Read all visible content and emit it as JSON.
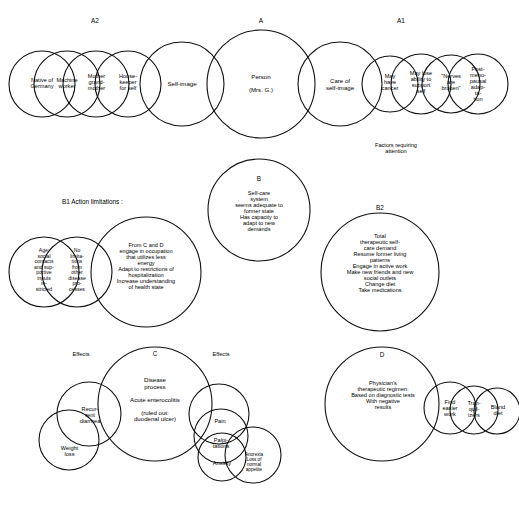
{
  "diagram": {
    "title_labels": {
      "a": "A",
      "a1": "A1",
      "a2": "A2",
      "b": "B",
      "b1": "B1  Action limitations :",
      "b2": "B2",
      "c": "C",
      "d": "D"
    },
    "annotations": {
      "factors_requiring_attention": "Factors requiring\nattention",
      "effects_left": "Effects",
      "effects_right": "Effects"
    },
    "nodes": {
      "person": "Person\n\n(Mrs. G.)",
      "self_image": "Self-image",
      "care_of_self_image": "Care of\nself-image",
      "housekeeper": "House-\nkeeper\nfor self",
      "mother_grandmother": "Mother\ngrand-\nmother",
      "machine_worker": "Machine\nworker",
      "native_of_germany": "Native of\nGermany",
      "may_have_cancer": "May\nhave\ncancer",
      "may_lose_ability": "May lose\nability to\nsupport\nself",
      "nerves_broken": "\"Nerves\nare\nbroken\"",
      "post_menopausal": "Post-\nmeno-\npausal\nadap-\nta-\ntion",
      "b_text": "Self-care\nsystem\nseems adequate to\nformer state\nHas capacity to\nadapt to new\ndemands",
      "b1_center": "From C and D\nengage in occupation\nthat utilizes less\nenergy\nAdapt to restrictions of\nhospitalization\nIncrease understanding\nof health state",
      "b1_left": "Age:\nsocial\ncontacts\nand sup-\nportive\ninputs\nre-\nstricted",
      "b1_mid": "No\nlimita-\ntions\nfrom\nother\ndisease\npro-\ncesses",
      "b2_text": "Total\ntherapeutic self-\ncare demand\nResume former living\npatterns\nEngage in active work\nMake new friends and new\nsocial outlets\nChange diet\nTake medications",
      "c_text": "Disease\nprocess\n\nAcute enterocolitis\n\n(ruled out:\nduodenal ulcer)",
      "c_weight_loss": "Weight\nloss",
      "c_recurrent_diarrhea": "Recur-\nrent\ndiarrhea",
      "c_pain": "Pain",
      "c_palpitations": "Palpi-\ntations",
      "c_anxiety": "Anxiety",
      "c_anorexia": "Anorexia\nLoss of\nnormal\nappetite",
      "d_text": "Physician's\ntherapeutic regimen:\nBased on diagnostic tests\nWith negative\nresults",
      "d_find_easier_work": "Find\neasier\nwork",
      "d_tranquilizers": "Tran-\nquil-\nizers",
      "d_bland_diet": "Bland\ndiet"
    }
  }
}
